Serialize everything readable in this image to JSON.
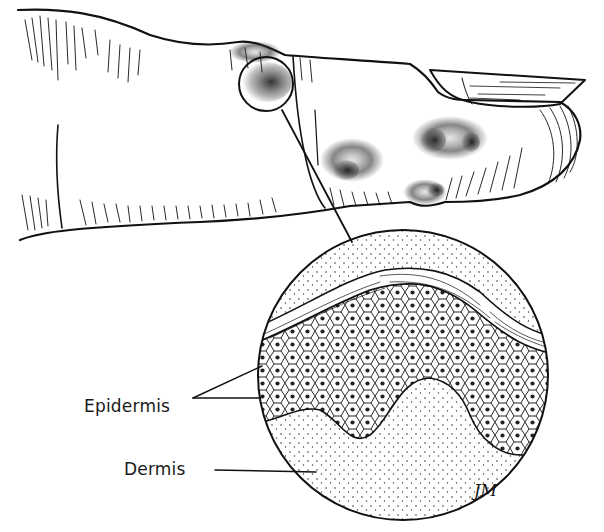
{
  "figure": {
    "labels": [
      {
        "id": "epidermis",
        "text": "Epidermis"
      },
      {
        "id": "dermis",
        "text": "Dermis"
      }
    ],
    "signature": "JM",
    "colors": {
      "line": "#111111",
      "background": "#ffffff",
      "stipple": "#222222"
    }
  }
}
